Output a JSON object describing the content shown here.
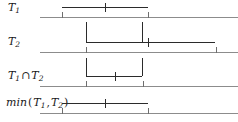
{
  "figure": {
    "type": "interval-timeline-diagram",
    "width": 238,
    "height": 122,
    "background": "#ffffff",
    "bar_color": "#2b2b2b",
    "axis_color": "#8c8c8c",
    "label_color": "#1a1a1a"
  },
  "rows": [
    {
      "id": "row-t1",
      "label_text": "T1",
      "label_base": "T",
      "label_sub": "1",
      "label_x": 8,
      "label_y": 2,
      "bar": {
        "y": 7,
        "start": 62,
        "end": 148,
        "point": 105
      },
      "axis": {
        "y": 17,
        "start": 40,
        "end": 238,
        "ticks": [
          62,
          148
        ]
      },
      "guides": []
    },
    {
      "id": "row-t2",
      "label_text": "T2",
      "label_base": "T",
      "label_sub": "2",
      "label_x": 8,
      "label_y": 36,
      "bar": {
        "y": 42,
        "start": 86,
        "end": 215,
        "point": 148
      },
      "axis": {
        "y": 52,
        "start": 40,
        "end": 238,
        "ticks": [
          86,
          216
        ]
      },
      "guides": [
        {
          "x": 86,
          "top": 22,
          "bottom": 42
        },
        {
          "x": 142,
          "top": 22,
          "bottom": 42
        }
      ]
    },
    {
      "id": "row-t1-cap-t2",
      "label_text": "T1 ∩ T2",
      "label_base": "T",
      "label_sub": "1",
      "label_op": "∩",
      "label_base2": "T",
      "label_sub2": "2",
      "label_x": 8,
      "label_y": 70,
      "bar": {
        "y": 76,
        "start": 86,
        "end": 142,
        "point": 115
      },
      "axis": {
        "y": 86,
        "start": 40,
        "end": 238,
        "ticks": [
          86,
          143
        ]
      },
      "guides": [
        {
          "x": 86,
          "top": 58,
          "bottom": 76
        },
        {
          "x": 142,
          "top": 58,
          "bottom": 76
        }
      ]
    },
    {
      "id": "row-min-t1-t2",
      "label_text": "min (T1, T2)",
      "label_fn": "min",
      "label_open": "(",
      "label_base": "T",
      "label_sub": "1",
      "label_comma": ",",
      "label_base2": "T",
      "label_sub2": "2",
      "label_close": ")",
      "label_x": 6,
      "label_y": 97,
      "bar": {
        "y": 103,
        "start": 62,
        "end": 148,
        "point": 105
      },
      "axis": {
        "y": 113,
        "start": 40,
        "end": 238,
        "ticks": [
          62,
          148
        ]
      },
      "guides": []
    }
  ]
}
